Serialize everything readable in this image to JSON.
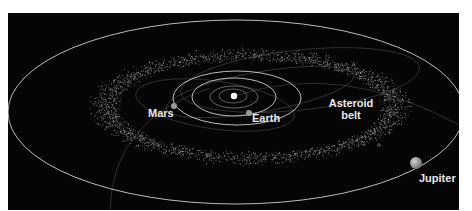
{
  "figure": {
    "type": "solar-system-orbit-diagram",
    "background_color": "#050505",
    "page_background": "#ffffff",
    "orbit_color": "#d9d9d9",
    "belt_color": "#8a8a8a"
  },
  "sun": {
    "x": 234,
    "y": 96,
    "r": 3.2,
    "color": "#ffffff"
  },
  "orbits": [
    {
      "name": "mercury-orbit",
      "cx": 233,
      "cy": 96,
      "rx": 14,
      "ry": 7,
      "opacity": 0.45
    },
    {
      "name": "venus-orbit",
      "cx": 234,
      "cy": 97,
      "rx": 24,
      "ry": 11,
      "opacity": 0.5
    },
    {
      "name": "earth-orbit",
      "cx": 234,
      "cy": 97,
      "rx": 42,
      "ry": 19,
      "opacity": 0.95
    },
    {
      "name": "mars-orbit",
      "cx": 237,
      "cy": 98,
      "rx": 64,
      "ry": 27,
      "opacity": 0.95
    },
    {
      "name": "jupiter-orbit",
      "cx": 236,
      "cy": 112,
      "rx": 228,
      "ry": 92,
      "opacity": 0.95
    }
  ],
  "planets": [
    {
      "name": "Earth",
      "x": 249,
      "y": 113,
      "r": 3,
      "color": "#9a9a9a"
    },
    {
      "name": "Mars",
      "x": 174,
      "y": 106,
      "r": 3,
      "color": "#9a9a9a"
    },
    {
      "name": "Jupiter",
      "x": 416,
      "y": 163,
      "r": 6,
      "color": "#a8a8a8"
    }
  ],
  "asteroid_belt": {
    "cx": 250,
    "cy": 106,
    "outer_rx": 165,
    "outer_ry": 60,
    "inner_rx": 108,
    "inner_ry": 36,
    "count": 2600
  },
  "labels": {
    "mars": "Mars",
    "earth": "Earth",
    "asteroid_belt_line1": "Asteroid",
    "asteroid_belt_line2": "belt",
    "jupiter": "Jupiter"
  }
}
